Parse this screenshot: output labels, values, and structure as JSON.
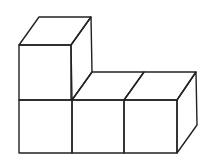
{
  "diagram": {
    "cube_count": 4,
    "layout": {
      "bottom_row": 3,
      "top_row": 1,
      "stacked_on": "left"
    },
    "colors": {
      "stroke": "#222222",
      "fill": "#ffffff",
      "background": "#ffffff"
    }
  }
}
